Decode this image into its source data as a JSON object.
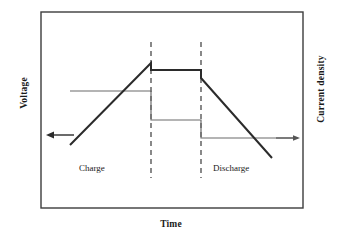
{
  "figure": {
    "type": "schematic-line-diagram",
    "axes": {
      "left_label": "Voltage",
      "right_label": "Current density",
      "bottom_label": "Time"
    },
    "region_labels": {
      "charge": "Charge",
      "discharge": "Discharge"
    },
    "colors": {
      "border": "#3d3d3d",
      "voltage_curve": "#2b2b2b",
      "current_curve": "#6b6b6b",
      "arrow": "#2b2b2b",
      "dashed_line": "#4a4a4a",
      "background": "#ffffff"
    },
    "plot_box": {
      "x": 41,
      "y": 12,
      "width": 262,
      "height": 196
    },
    "dashed_dividers": [
      {
        "name": "charge-end-divider",
        "x": 151,
        "y_top": 42,
        "y_bottom": 178
      },
      {
        "name": "rest-end-divider",
        "x": 201,
        "y_top": 42,
        "y_bottom": 178
      }
    ],
    "voltage_curve": {
      "name": "voltage-trace",
      "points": "70,145 151,63 151,70 201,70 201,78 272,158",
      "stroke_width": 2.0
    },
    "current_curve": {
      "name": "current-density-trace",
      "points": "70,91 151,91 151,120 201,120 201,138 298,138",
      "stroke_width": 1.2
    },
    "arrows": {
      "left": {
        "name": "voltage-direction-arrow",
        "direction": "left",
        "x_start": 74,
        "x_end": 47,
        "y": 135
      },
      "right": {
        "name": "current-direction-arrow",
        "direction": "right",
        "x_start": 275,
        "x_end": 300,
        "y": 138
      }
    }
  },
  "chart_data": {
    "type": "line",
    "title": "",
    "xlabel": "Time",
    "ylabel": "Voltage",
    "y2label": "Current density",
    "grid": false,
    "legend": null,
    "annotations": [
      "Charge",
      "Discharge"
    ],
    "phases": [
      {
        "name": "Charge",
        "t_start": 0.0,
        "t_end": 1.0
      },
      {
        "name": "Rest / constant-voltage hold",
        "t_start": 1.0,
        "t_end": 1.62
      },
      {
        "name": "Discharge",
        "t_start": 1.62,
        "t_end": 2.5
      }
    ],
    "series": [
      {
        "name": "Voltage",
        "axis": "left",
        "x": [
          0.0,
          1.0,
          1.0,
          1.62,
          1.62,
          2.5
        ],
        "values": [
          0.0,
          1.0,
          0.92,
          0.92,
          0.82,
          0.0
        ]
      },
      {
        "name": "Current density",
        "axis": "right",
        "x": [
          0.0,
          1.0,
          1.0,
          1.62,
          1.62,
          2.82
        ],
        "values": [
          0.66,
          0.66,
          0.31,
          0.31,
          0.1,
          0.1
        ]
      }
    ],
    "xlim": [
      0.0,
      3.0
    ],
    "ylim": [
      0.0,
      1.15
    ]
  }
}
